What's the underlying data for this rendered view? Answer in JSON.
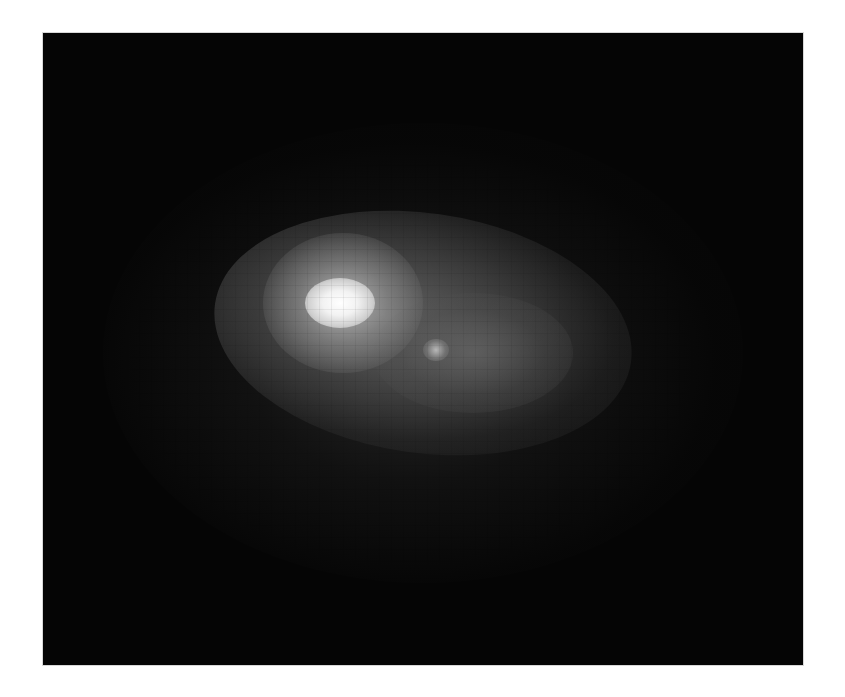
{
  "image": {
    "subject": "galaxy",
    "alt": "Pixelated grayscale astronomical image of a galaxy with a bright core and a fainter secondary knot",
    "background_color": "#050505",
    "core_color": "#ffffff",
    "frame_border_color": "#d8d8d8"
  }
}
